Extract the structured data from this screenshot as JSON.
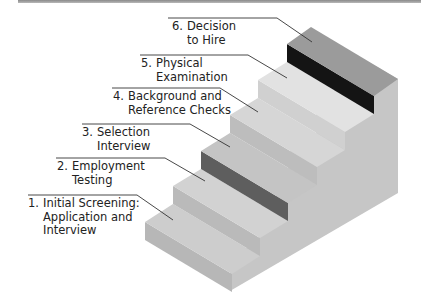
{
  "diagram": {
    "steps": [
      {
        "number": "1.",
        "line1": "Initial Screening:",
        "line2": "Application and",
        "line3": "Interview"
      },
      {
        "number": "2.",
        "line1": "Employment",
        "line2": "Testing"
      },
      {
        "number": "3.",
        "line1": "Selection",
        "line2": "Interview"
      },
      {
        "number": "4.",
        "line1": "Background and",
        "line2": "Reference Checks"
      },
      {
        "number": "5.",
        "line1": "Physical",
        "line2": "Examination"
      },
      {
        "number": "6.",
        "line1": "Decision",
        "line2": "to Hire"
      }
    ],
    "colors": {
      "side": "#c9c9c9",
      "tread": "#cfcfcf",
      "riser": "#b9b9b9",
      "riser_step3": "#5e5e5e",
      "riser_step6": "#141414",
      "tread_step5": "#e2e2e2",
      "tread_step6": "#9b9b9b",
      "leader": "#333333"
    }
  }
}
